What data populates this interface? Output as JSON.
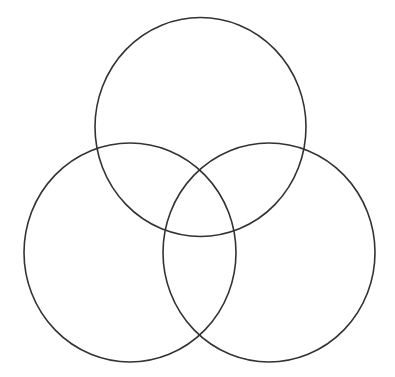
{
  "diagram": {
    "type": "venn",
    "set_count": 3,
    "background": "#ffffff",
    "stroke_color": "#333333",
    "circles": [
      {
        "id": "top",
        "label": "",
        "cx": 200.5,
        "cy": 127,
        "rx": 105.5,
        "ry": 109.5
      },
      {
        "id": "bottom-left",
        "label": "",
        "cx": 130,
        "cy": 252.5,
        "rx": 106,
        "ry": 109.5
      },
      {
        "id": "bottom-right",
        "label": "",
        "cx": 269,
        "cy": 252.5,
        "rx": 106,
        "ry": 109.5
      }
    ]
  }
}
